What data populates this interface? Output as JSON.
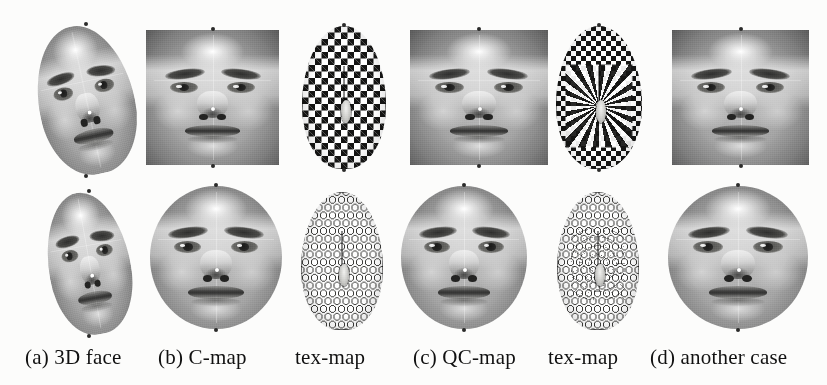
{
  "figure": {
    "background_color": "#fcfcfb",
    "ink_color": "#141413",
    "rows": 2,
    "columns": 6,
    "caption_font_size_px": 21
  },
  "caption": {
    "items": [
      {
        "label": "(a) 3D face",
        "x": 25
      },
      {
        "label": "(b) C-map",
        "x": 158
      },
      {
        "label": "tex-map",
        "x": 295
      },
      {
        "label": "(c) QC-map",
        "x": 413
      },
      {
        "label": "tex-map",
        "x": 548
      },
      {
        "label": "(d) another case",
        "x": 650
      }
    ]
  },
  "panels": {
    "top": [
      {
        "name": "3d-face-top",
        "kind": "face",
        "shape": "oval",
        "tilt": -12,
        "x": 38,
        "y": 25,
        "w": 96,
        "h": 150
      },
      {
        "name": "c-map-top",
        "kind": "face",
        "shape": "rect",
        "tilt": 0,
        "x": 146,
        "y": 30,
        "w": 133,
        "h": 135
      },
      {
        "name": "tex-map-c-top",
        "kind": "checker",
        "shape": "oval",
        "tilt": 0,
        "x": 302,
        "y": 26,
        "w": 84,
        "h": 143
      },
      {
        "name": "qc-map-top",
        "kind": "face",
        "shape": "rect",
        "tilt": 0,
        "x": 410,
        "y": 30,
        "w": 138,
        "h": 135
      },
      {
        "name": "tex-map-qc-top",
        "kind": "swirl",
        "shape": "oval",
        "tilt": 0,
        "x": 556,
        "y": 26,
        "w": 86,
        "h": 143
      },
      {
        "name": "another-case-top",
        "kind": "face",
        "shape": "rect",
        "tilt": 0,
        "x": 672,
        "y": 30,
        "w": 137,
        "h": 135
      }
    ],
    "bottom": [
      {
        "name": "3d-face-bottom",
        "kind": "face",
        "shape": "oval",
        "tilt": -10,
        "x": 48,
        "y": 192,
        "w": 82,
        "h": 143
      },
      {
        "name": "c-map-bottom",
        "kind": "face",
        "shape": "circle",
        "tilt": 0,
        "x": 150,
        "y": 186,
        "w": 132,
        "h": 143
      },
      {
        "name": "tex-map-c-bottom",
        "kind": "packing",
        "shape": "oval",
        "tilt": 0,
        "x": 301,
        "y": 192,
        "w": 82,
        "h": 138
      },
      {
        "name": "qc-map-bottom",
        "kind": "face",
        "shape": "circle",
        "tilt": 0,
        "x": 401,
        "y": 186,
        "w": 126,
        "h": 143
      },
      {
        "name": "tex-map-qc-bottom",
        "kind": "packing-radial",
        "shape": "oval",
        "tilt": 0,
        "x": 557,
        "y": 192,
        "w": 82,
        "h": 138
      },
      {
        "name": "another-case-bottom",
        "kind": "face",
        "shape": "circle",
        "tilt": 0,
        "x": 668,
        "y": 186,
        "w": 140,
        "h": 143
      }
    ]
  },
  "subject": {
    "description": "female face",
    "rendering": "grayscale"
  }
}
